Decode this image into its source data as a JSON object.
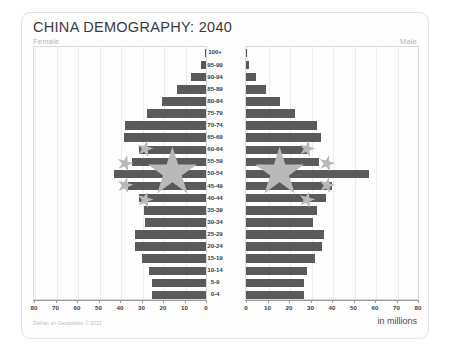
{
  "card": {
    "title": "CHINA DEMOGRAPHY: 2040",
    "female_label": "Female",
    "male_label": "Male",
    "credit": "Zeihan on Geopolitics © 2012",
    "units": "in millions"
  },
  "colors": {
    "bar": "#5a5a5a",
    "grid": "#ededed",
    "frame": "#d8d8d8",
    "axis": "#9a9a9a",
    "star": "#b9b9b9",
    "title_text": "#3b3b3b",
    "muted_text": "#b6b6b6"
  },
  "chart_data": {
    "type": "bar",
    "title": "CHINA DEMOGRAPHY: 2040",
    "subtype": "population-pyramid",
    "xlabel": "in millions",
    "ylabel": "",
    "xlim": [
      0,
      80
    ],
    "grid": true,
    "legend_position": "none",
    "tick_labels_female": [
      80,
      70,
      60,
      50,
      40,
      30,
      20,
      10,
      0
    ],
    "tick_labels_male": [
      0,
      10,
      20,
      30,
      40,
      50,
      60,
      70,
      80
    ],
    "categories": [
      "100+",
      "95-99",
      "90-94",
      "85-89",
      "80-84",
      "75-79",
      "70-74",
      "65-69",
      "60-64",
      "55-59",
      "50-54",
      "45-49",
      "40-44",
      "35-39",
      "30-34",
      "25-29",
      "20-24",
      "15-19",
      "10-14",
      "5-9",
      "0-4"
    ],
    "series": [
      {
        "name": "Female",
        "side": "left",
        "values": [
          0.4,
          2.5,
          7.0,
          13.5,
          20.5,
          27.5,
          37.5,
          38.0,
          31.0,
          34.5,
          43.0,
          36.5,
          31.0,
          29.0,
          28.5,
          33.0,
          33.0,
          30.0,
          26.5,
          25.0,
          25.0
        ]
      },
      {
        "name": "Male",
        "side": "right",
        "values": [
          0.2,
          1.3,
          4.5,
          9.5,
          16.0,
          23.0,
          33.0,
          35.0,
          29.5,
          34.0,
          57.0,
          40.0,
          37.0,
          33.0,
          31.0,
          36.5,
          35.5,
          32.0,
          28.5,
          27.0,
          27.0
        ]
      }
    ]
  }
}
